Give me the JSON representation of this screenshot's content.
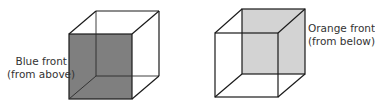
{
  "figure": {
    "left_cube": {
      "label_line1": "Blue front",
      "label_line2": "(from above)",
      "shaded_face": "front",
      "fill_color": "#7f7f7f"
    },
    "right_cube": {
      "label_line1": "Orange front",
      "label_line2": "(from below)",
      "shaded_face": "back",
      "fill_color": "#d3d3d3"
    },
    "edge_color": "#1a1a1a"
  }
}
